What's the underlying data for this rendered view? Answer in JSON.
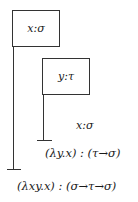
{
  "diagram": {
    "type": "fitch-style natural deduction",
    "assumptions": [
      {
        "id": "outer",
        "label": "x:σ"
      },
      {
        "id": "inner",
        "label": "y:τ"
      }
    ],
    "lines": [
      {
        "id": "reiterate",
        "text": "x:σ"
      },
      {
        "id": "inner-conclusion",
        "text": "(λy.x) : (τ→σ)"
      },
      {
        "id": "outer-conclusion",
        "text": "(λxy.x) : (σ→τ→σ)"
      }
    ]
  }
}
